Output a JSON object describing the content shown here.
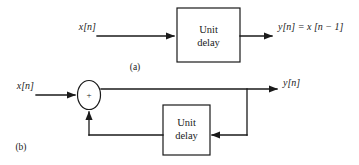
{
  "figure": {
    "background_color": "#ffffff",
    "line_color": "#1a1a1a",
    "width": 359,
    "height": 165
  },
  "panel_a": {
    "caption": "(a)",
    "input_label": "x[n]",
    "output_label": "y[n] = x [n − 1]",
    "block": {
      "line1": "Unit",
      "line2": "delay"
    }
  },
  "panel_b": {
    "caption": "(b)",
    "input_label": "x[n]",
    "output_label": "y[n]",
    "adder_sign": "+",
    "block": {
      "line1": "Unit",
      "line2": "delay"
    }
  }
}
